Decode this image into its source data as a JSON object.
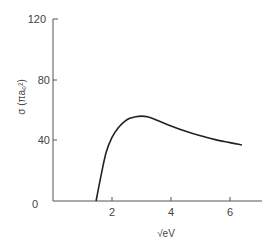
{
  "chart_data": {
    "type": "line",
    "title": "",
    "xlabel": "√eV",
    "ylabel": "σ (πa₀²)",
    "xlim": [
      0,
      7
    ],
    "ylim": [
      0,
      120
    ],
    "xticks": [
      "0",
      "2",
      "4",
      "6"
    ],
    "yticks": [
      "0",
      "40",
      "80",
      "120"
    ],
    "grid": false,
    "series": [
      {
        "name": "cross section",
        "x": [
          1.46,
          1.6,
          1.8,
          2.0,
          2.2,
          2.4,
          2.6,
          2.8,
          3.0,
          3.2,
          3.5,
          4.0,
          4.5,
          5.0,
          5.5,
          6.0,
          6.4
        ],
        "y": [
          0,
          14,
          32,
          42,
          48,
          52,
          54.5,
          55.5,
          56,
          55.5,
          53.5,
          49.5,
          46,
          43,
          40.5,
          38.5,
          37
        ]
      }
    ]
  }
}
